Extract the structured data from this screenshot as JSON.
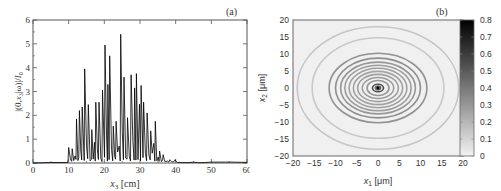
{
  "chart_data": [
    {
      "panel_label": "(a)",
      "type": "line",
      "title": "",
      "xlabel": "x3 [cm]",
      "xlabel_main": "x",
      "xlabel_sub": "3",
      "xlabel_unit": " [cm]",
      "ylabel": "|(0,x3|ω)|/I0",
      "xlim": [
        0,
        60
      ],
      "ylim": [
        0,
        6
      ],
      "x_ticks": [
        0,
        10,
        20,
        30,
        40,
        50,
        60
      ],
      "y_ticks": [
        0,
        1,
        2,
        3,
        4,
        5,
        6
      ],
      "grid": false,
      "legend": null,
      "color": "#000000",
      "peaks": [
        {
          "x": 10.0,
          "y": 0.65
        },
        {
          "x": 11.0,
          "y": 0.6
        },
        {
          "x": 12.2,
          "y": 1.85
        },
        {
          "x": 13.0,
          "y": 2.2
        },
        {
          "x": 13.8,
          "y": 2.35
        },
        {
          "x": 14.5,
          "y": 3.95
        },
        {
          "x": 15.5,
          "y": 2.45
        },
        {
          "x": 16.5,
          "y": 1.4
        },
        {
          "x": 17.6,
          "y": 2.55
        },
        {
          "x": 18.5,
          "y": 2.55
        },
        {
          "x": 19.5,
          "y": 3.05
        },
        {
          "x": 20.2,
          "y": 4.95
        },
        {
          "x": 21.0,
          "y": 3.3
        },
        {
          "x": 21.5,
          "y": 4.5
        },
        {
          "x": 22.5,
          "y": 1.55
        },
        {
          "x": 23.3,
          "y": 1.75
        },
        {
          "x": 24.6,
          "y": 5.4
        },
        {
          "x": 25.5,
          "y": 3.6
        },
        {
          "x": 26.5,
          "y": 1.9
        },
        {
          "x": 27.5,
          "y": 3.7
        },
        {
          "x": 28.5,
          "y": 3.15
        },
        {
          "x": 29.0,
          "y": 3.75
        },
        {
          "x": 30.3,
          "y": 3.25
        },
        {
          "x": 31.0,
          "y": 2.55
        },
        {
          "x": 32.0,
          "y": 2.1
        },
        {
          "x": 33.0,
          "y": 1.35
        },
        {
          "x": 34.3,
          "y": 1.75
        },
        {
          "x": 35.5,
          "y": 0.5
        },
        {
          "x": 36.5,
          "y": 0.35
        },
        {
          "x": 38.5,
          "y": 0.1
        },
        {
          "x": 40.0,
          "y": 0.08
        }
      ]
    },
    {
      "panel_label": "(b)",
      "type": "heatmap",
      "title": "",
      "xlabel": "x1 [μm]",
      "xlabel_main": "x",
      "xlabel_sub": "1",
      "xlabel_unit": " [μm]",
      "ylabel": "x2 [μm]",
      "ylabel_main": "x",
      "ylabel_sub": "2",
      "ylabel_unit": " [μm]",
      "xlim": [
        -20,
        20
      ],
      "ylim": [
        -20,
        20
      ],
      "x_ticks": [
        -20,
        -15,
        -10,
        -5,
        0,
        5,
        10,
        15,
        20
      ],
      "y_ticks": [
        -20,
        -15,
        -10,
        -5,
        0,
        5,
        10,
        15,
        20
      ],
      "colorbar": {
        "min": 0,
        "max": 0.8,
        "ticks": [
          0,
          0.1,
          0.2,
          0.3,
          0.4,
          0.5,
          0.6,
          0.7,
          0.8
        ],
        "colormap": "gray_r"
      },
      "description": "Concentric elliptical rings centered at origin; dark central spot (~0.8), ring radii (x1 direction) approx 1.5, 3, 4, 5, 6, 7, 8, 9, 10.5, and outer faint ring ~19",
      "rings": [
        {
          "rx": 1.3,
          "ry": 1.1,
          "intensity": 0.55
        },
        {
          "rx": 2.6,
          "ry": 2.2,
          "intensity": 0.3
        },
        {
          "rx": 3.7,
          "ry": 3.1,
          "intensity": 0.28
        },
        {
          "rx": 4.8,
          "ry": 4.0,
          "intensity": 0.27
        },
        {
          "rx": 5.8,
          "ry": 4.9,
          "intensity": 0.26
        },
        {
          "rx": 6.8,
          "ry": 5.8,
          "intensity": 0.27
        },
        {
          "rx": 7.8,
          "ry": 6.7,
          "intensity": 0.28
        },
        {
          "rx": 8.8,
          "ry": 7.6,
          "intensity": 0.3
        },
        {
          "rx": 10.0,
          "ry": 8.8,
          "intensity": 0.33
        },
        {
          "rx": 11.5,
          "ry": 10.2,
          "intensity": 0.32
        },
        {
          "rx": 15.5,
          "ry": 14.8,
          "intensity": 0.14
        },
        {
          "rx": 19.0,
          "ry": 18.0,
          "intensity": 0.15
        }
      ],
      "center_intensity": 0.8
    }
  ]
}
